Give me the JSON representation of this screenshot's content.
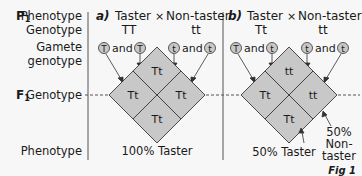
{
  "labels": {
    "p1": "P",
    "p1_sub": "1",
    "phenotype": "Phenotype",
    "genotype": "Genotype",
    "gamete_line1": "Gamete",
    "gamete_line2": "genotype",
    "f1": "F",
    "f1_sub": "1",
    "f1_genotype": "Genotype",
    "f1_phenotype": "Phenotype",
    "figure": "Fig 1"
  },
  "panels": [
    {
      "id": "a",
      "letter": "a)",
      "parent1_phenotype": "Taster",
      "cross_symbol": "×",
      "parent2_phenotype": "Non-taster",
      "parent1_genotype": "TT",
      "parent2_genotype": "tt",
      "gametes": [
        "T",
        "T",
        "t",
        "t"
      ],
      "and_label": "and",
      "cells": {
        "top": "Tt",
        "left": "Tt",
        "right": "Tt",
        "bottom": "Tt"
      },
      "result": "100% Taster"
    },
    {
      "id": "b",
      "letter": "b)",
      "parent1_phenotype": "Taster",
      "cross_symbol": "×",
      "parent2_phenotype": "Non-taster",
      "parent1_genotype": "Tt",
      "parent2_genotype": "tt",
      "gametes": [
        "T",
        "t",
        "t",
        "t"
      ],
      "and_label": "and",
      "cells": {
        "top": "tt",
        "left": "Tt",
        "right": "tt",
        "bottom": "Tt"
      },
      "result_taster": "50% Taster",
      "result_nontaster_1": "50%",
      "result_nontaster_2": "Non-",
      "result_nontaster_3": "taster"
    }
  ],
  "colors": {
    "cell_fill": "#c8c8c8",
    "cell_stroke": "#3a3a3a",
    "gamete_fill": "#c8c8c8",
    "background": "#f7f7f7"
  }
}
